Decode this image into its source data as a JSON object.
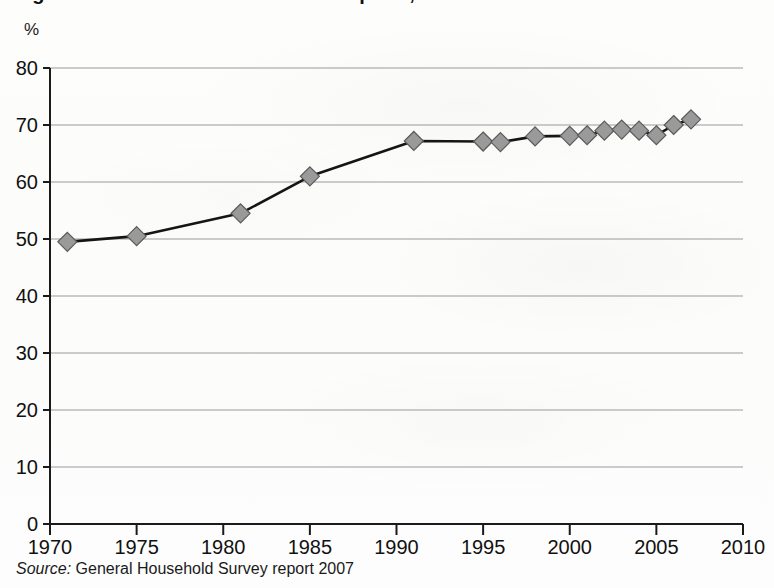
{
  "chart_data": {
    "type": "line",
    "title": "Figure: Households with home computer, 1970 to 2007",
    "ylabel": "%",
    "xlabel": "",
    "ylim": [
      0,
      80
    ],
    "xlim": [
      1970,
      2010
    ],
    "grid": true,
    "legend": "none",
    "y_ticks": [
      80,
      70,
      60,
      50,
      40,
      30,
      20,
      10,
      0
    ],
    "x_ticks": [
      1970,
      1975,
      1980,
      1985,
      1990,
      1995,
      2000,
      2005,
      2010
    ],
    "x": [
      1971,
      1975,
      1981,
      1985,
      1991,
      1995,
      1996,
      1998,
      2000,
      2001,
      2002,
      2003,
      2004,
      2005,
      2006,
      2007
    ],
    "values": [
      49.5,
      50.5,
      54.5,
      61.0,
      67.2,
      67.1,
      67.0,
      68.0,
      68.1,
      68.2,
      69.0,
      69.2,
      69.0,
      68.2,
      70.0,
      71.0
    ],
    "series": [
      {
        "name": "percentage",
        "values": [
          49.5,
          50.5,
          54.5,
          61.0,
          67.2,
          67.1,
          67.0,
          68.0,
          68.1,
          68.2,
          69.0,
          69.2,
          69.0,
          68.2,
          70.0,
          71.0
        ]
      }
    ],
    "marker": "diamond",
    "marker_color": "#9a9a9a",
    "marker_edge_color": "#5a5a5a",
    "line_color": "#151515",
    "gridline_color": "#9a9a9a",
    "axis_color": "#1a1a1a"
  },
  "source": {
    "label": "Source:",
    "text": "General Household Survey report 2007"
  }
}
